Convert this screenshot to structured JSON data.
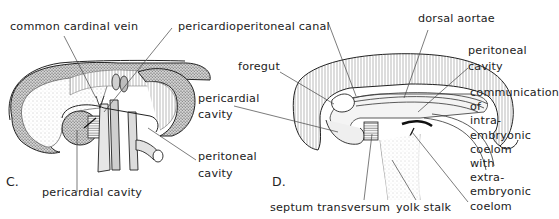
{
  "figure": {
    "panels": [
      {
        "id": "C",
        "letter": "C.",
        "labels": {
          "common_cardinal_vein": "common cardinal vein",
          "pericardioperitoneal_canal": "pericardioperitoneal canal",
          "pericardial_cavity": "pericardial cavity",
          "peritoneal_cavity_line1": "peritoneal",
          "peritoneal_cavity_line2": "cavity"
        }
      },
      {
        "id": "D",
        "letter": "D.",
        "labels": {
          "foregut": "foregut",
          "pericardial_cavity_line1": "pericardial",
          "pericardial_cavity_line2": "cavity",
          "dorsal_aortae": "dorsal aortae",
          "peritoneal_cavity_line1": "peritoneal",
          "peritoneal_cavity_line2": "cavity",
          "communication": [
            "communication",
            "of",
            "intra-",
            "embryonic",
            "coelom",
            "with",
            "extra-",
            "embryonic",
            "coelom"
          ],
          "septum_transversum": "septum transversum",
          "yolk_stalk": "yolk stalk"
        }
      }
    ]
  }
}
